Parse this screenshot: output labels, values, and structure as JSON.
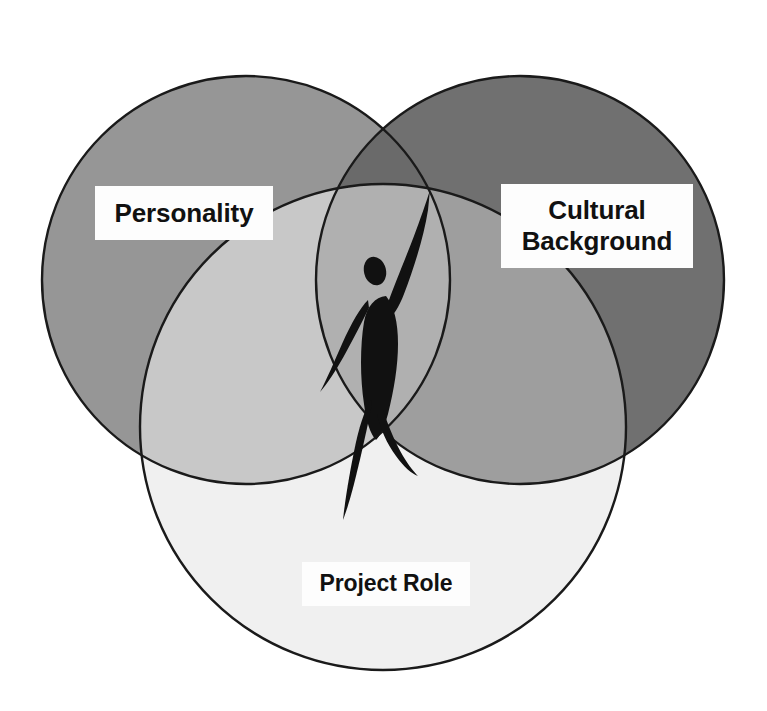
{
  "diagram": {
    "type": "venn",
    "set_count": 3,
    "background_color": "#ffffff",
    "outline_color": "#1a1a1a",
    "sets": [
      {
        "id": "personality",
        "label": "Personality",
        "position": "top-left",
        "fill_color": "#969696",
        "center_x": 246,
        "center_y": 280,
        "radius": 204
      },
      {
        "id": "cultural-background",
        "label": "Cultural Background",
        "label_lines": [
          "Cultural",
          "Background"
        ],
        "position": "top-right",
        "fill_color": "#707070",
        "center_x": 520,
        "center_y": 280,
        "radius": 204
      },
      {
        "id": "project-role",
        "label": "Project Role",
        "position": "bottom-center",
        "fill_color": "#f0f0f0",
        "center_x": 383,
        "center_y": 427,
        "radius": 243
      }
    ],
    "overlaps": [
      {
        "id": "personality-cultural",
        "fill_color": "#6a6a6a"
      },
      {
        "id": "personality-project",
        "fill_color": "#c8c8c8"
      },
      {
        "id": "cultural-project",
        "fill_color": "#9e9e9e"
      },
      {
        "id": "all-three",
        "fill_color": "#b0b0b0"
      }
    ],
    "center_figure": {
      "name": "person-silhouette",
      "description": "stylized human figure with one arm raised",
      "color": "#111111"
    }
  },
  "labels": {
    "personality": "Personality",
    "cultural_line1": "Cultural",
    "cultural_line2": "Background",
    "project_role": "Project Role"
  }
}
